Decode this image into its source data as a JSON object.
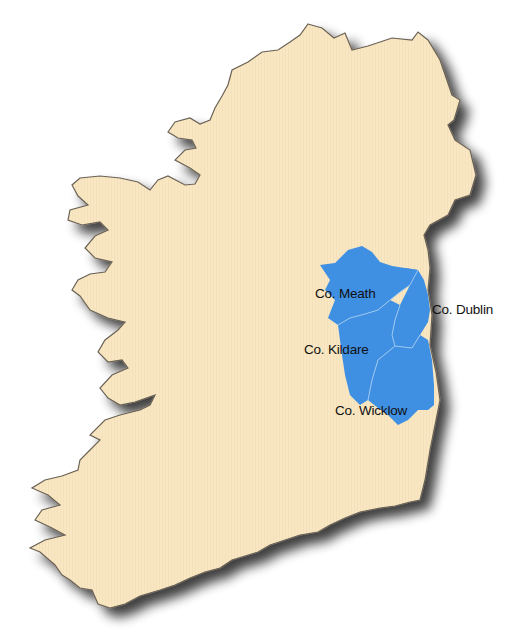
{
  "map": {
    "subject": "Ireland",
    "land_color": "#F8E7C2",
    "coast_color": "#6b6256",
    "shadow_color": "#555555",
    "highlight_color": "#3F8FE3",
    "border_color": "#9cc8f2",
    "highlighted_counties": [
      {
        "id": "meath",
        "label": "Co. Meath"
      },
      {
        "id": "dublin",
        "label": "Co. Dublin"
      },
      {
        "id": "kildare",
        "label": "Co. Kildare"
      },
      {
        "id": "wicklow",
        "label": "Co. Wicklow"
      }
    ]
  }
}
